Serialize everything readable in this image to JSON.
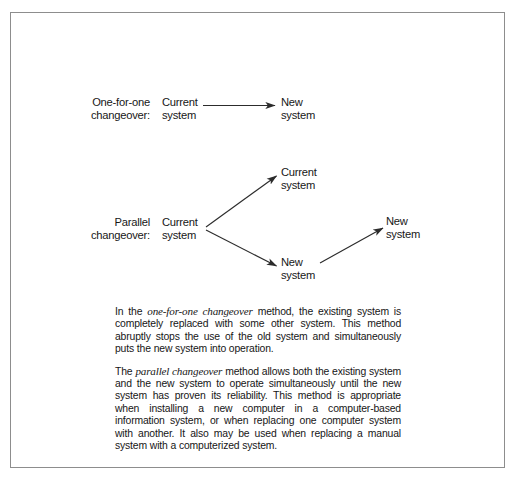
{
  "figure": {
    "frame_border_color": "#8d8d8d",
    "background_color": "#ffffff",
    "ink_color": "#171717"
  },
  "diagram": {
    "rows": [
      {
        "row_label": "One-for-one\nchangeover:",
        "nodes": {
          "source": "Current\nsystem",
          "target": "New\nsystem"
        }
      },
      {
        "row_label": "Parallel\nchangeover:",
        "nodes": {
          "source": "Current\nsystem",
          "branch_top": "Current\nsystem",
          "branch_bottom": "New\nsystem",
          "converge": "New\nsystem"
        }
      }
    ]
  },
  "body": {
    "paragraph_one": {
      "lead": "In the ",
      "term": "one-for-one changeover",
      "rest": " method, the existing system is completely replaced with some other system. This method abruptly stops the use of the old system and simultaneously puts the new system into operation."
    },
    "paragraph_two": {
      "lead": "The ",
      "term": "parallel changeover",
      "rest": " method allows both the existing system and the new system to operate simultaneously until the new system has proven its reliability. This method is appropriate when installing a new computer in a computer-based information system, or when replacing one computer system with another. It also may be used when replacing a manual system with a computerized system."
    }
  }
}
